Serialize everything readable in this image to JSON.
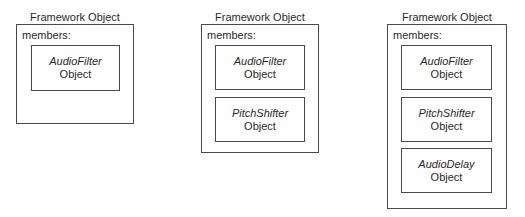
{
  "panels": [
    {
      "title": "Framework Object",
      "members_label": "members:",
      "members": [
        {
          "class_name": "AudioFilter",
          "suffix": "Object"
        }
      ]
    },
    {
      "title": "Framework Object",
      "members_label": "members:",
      "members": [
        {
          "class_name": "AudioFilter",
          "suffix": "Object"
        },
        {
          "class_name": "PitchShifter",
          "suffix": "Object"
        }
      ]
    },
    {
      "title": "Framework Object",
      "members_label": "members:",
      "members": [
        {
          "class_name": "AudioFilter",
          "suffix": "Object"
        },
        {
          "class_name": "PitchShifter",
          "suffix": "Object"
        },
        {
          "class_name": "AudioDelay",
          "suffix": "Object"
        }
      ]
    }
  ],
  "colors": {
    "border": "#4a4a4a",
    "text": "#2a2a2a",
    "background": "#ffffff"
  }
}
